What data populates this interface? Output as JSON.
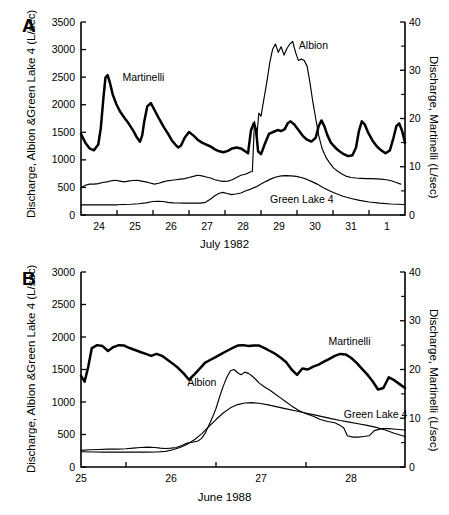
{
  "figure": {
    "panels": [
      {
        "letter": "A",
        "ylabel_left": "Discharge, Albion &Green Lake 4 (L/sec)",
        "ylabel_right": "Discharge, Martinelli (L/sec)",
        "xlabel": "July 1982"
      },
      {
        "letter": "B",
        "ylabel_left": "Discharge, Albion &Green Lake 4 (L/sec)",
        "ylabel_right": "Discharge, Martinelli (L/sec)",
        "xlabel": "June 1988"
      }
    ]
  },
  "chart_data": [
    {
      "type": "line",
      "title": "",
      "panel": "A",
      "xlabel": "July 1982",
      "ylabel": "Discharge, Albion &Green Lake 4 (L/sec)",
      "ylabel_right": "Discharge, Martinelli (L/sec)",
      "xlim": [
        23.5,
        32.5
      ],
      "ylim": [
        0,
        3500
      ],
      "ylim_right": [
        0,
        40
      ],
      "yticks": [
        0,
        500,
        1000,
        1500,
        2000,
        2500,
        3000,
        3500
      ],
      "yticks_right": [
        0,
        10,
        20,
        30,
        40
      ],
      "yticks_right_minor": [
        5,
        15,
        25,
        35
      ],
      "xticks": [
        24,
        25,
        26,
        27,
        28,
        29,
        30,
        31,
        32
      ],
      "xticklabels": [
        "24",
        "25",
        "26",
        "27",
        "28",
        "29",
        "30",
        "31",
        "1"
      ],
      "grid": false,
      "legend_position": "inline-annotations",
      "annotations": [
        {
          "text": "Martinelli",
          "x": 24.65,
          "y": 2430
        },
        {
          "text": "Albion",
          "x": 29.55,
          "y": 3010
        },
        {
          "text": "Green Lake 4",
          "x": 28.75,
          "y": 215
        }
      ],
      "series": [
        {
          "name": "Martinelli",
          "axis": "right",
          "units": "L/sec",
          "style": "thick",
          "x": [
            23.5,
            23.62,
            23.74,
            23.86,
            23.98,
            24.05,
            24.12,
            24.18,
            24.24,
            24.3,
            24.38,
            24.48,
            24.58,
            24.7,
            24.82,
            24.95,
            25.06,
            25.14,
            25.2,
            25.26,
            25.34,
            25.44,
            25.56,
            25.68,
            25.8,
            25.92,
            26.02,
            26.12,
            26.2,
            26.28,
            26.38,
            26.5,
            26.62,
            26.74,
            26.86,
            26.98,
            27.1,
            27.22,
            27.34,
            27.46,
            27.58,
            27.7,
            27.82,
            27.94,
            28.06,
            28.14,
            28.22,
            28.3,
            28.36,
            28.42,
            28.5,
            28.6,
            28.72,
            28.84,
            28.96,
            29.06,
            29.16,
            29.24,
            29.32,
            29.42,
            29.54,
            29.66,
            29.78,
            29.9,
            30.02,
            30.1,
            30.18,
            30.26,
            30.34,
            30.44,
            30.56,
            30.68,
            30.8,
            30.92,
            31.04,
            31.14,
            31.22,
            31.3,
            31.38,
            31.48,
            31.6,
            31.72,
            31.84,
            31.96,
            32.08,
            32.18,
            32.26,
            32.34,
            32.42,
            32.5
          ],
          "y_right": [
            16.8,
            15.0,
            13.8,
            13.4,
            14.6,
            18.0,
            24.0,
            28.5,
            29.0,
            27.5,
            25.0,
            23.0,
            21.5,
            20.2,
            19.0,
            17.5,
            16.0,
            15.2,
            16.5,
            19.5,
            22.5,
            23.2,
            21.5,
            19.8,
            18.2,
            16.8,
            15.5,
            14.6,
            14.0,
            14.4,
            16.0,
            17.2,
            16.5,
            15.6,
            15.0,
            14.6,
            14.2,
            13.6,
            13.2,
            13.0,
            13.3,
            13.8,
            14.0,
            13.8,
            13.2,
            12.8,
            17.5,
            19.0,
            17.8,
            13.2,
            12.6,
            14.6,
            16.8,
            17.2,
            17.6,
            17.4,
            17.8,
            19.0,
            19.4,
            18.8,
            17.6,
            16.4,
            15.6,
            15.2,
            16.0,
            18.4,
            19.6,
            18.4,
            16.6,
            15.0,
            14.0,
            13.2,
            12.6,
            12.2,
            12.4,
            14.0,
            17.4,
            19.4,
            18.8,
            17.0,
            15.4,
            14.2,
            13.4,
            12.8,
            13.4,
            16.0,
            18.4,
            19.0,
            17.4,
            15.0
          ]
        },
        {
          "name": "Albion",
          "axis": "left",
          "units": "L/sec",
          "style": "thin",
          "x": [
            23.5,
            23.62,
            23.74,
            23.86,
            23.98,
            24.1,
            24.22,
            24.34,
            24.46,
            24.58,
            24.7,
            24.82,
            24.94,
            25.06,
            25.18,
            25.3,
            25.42,
            25.54,
            25.66,
            25.78,
            25.9,
            26.02,
            26.14,
            26.26,
            26.38,
            26.5,
            26.62,
            26.74,
            26.86,
            26.98,
            27.1,
            27.22,
            27.34,
            27.46,
            27.58,
            27.7,
            27.82,
            27.94,
            28.06,
            28.14,
            28.2,
            28.26,
            28.32,
            28.38,
            28.44,
            28.5,
            28.58,
            28.66,
            28.74,
            28.82,
            28.9,
            28.98,
            29.06,
            29.14,
            29.22,
            29.3,
            29.38,
            29.46,
            29.54,
            29.62,
            29.7,
            29.78,
            29.86,
            29.94,
            30.02,
            30.1,
            30.2,
            30.3,
            30.4,
            30.52,
            30.64,
            30.76,
            30.88,
            31.0,
            31.14,
            31.28,
            31.42,
            31.56,
            31.7,
            31.84,
            31.98,
            32.12,
            32.26,
            32.38,
            32.5
          ],
          "y": [
            490,
            540,
            560,
            560,
            570,
            590,
            600,
            620,
            630,
            615,
            600,
            615,
            625,
            630,
            615,
            600,
            580,
            560,
            575,
            600,
            620,
            630,
            640,
            650,
            660,
            680,
            700,
            720,
            710,
            690,
            670,
            640,
            620,
            610,
            615,
            640,
            680,
            720,
            740,
            760,
            780,
            790,
            1700,
            1400,
            1850,
            1790,
            2100,
            2400,
            2750,
            3000,
            3100,
            2950,
            3050,
            2900,
            3020,
            3100,
            3150,
            2950,
            2800,
            2830,
            2800,
            2700,
            2400,
            2050,
            1750,
            1450,
            1200,
            1050,
            950,
            850,
            790,
            740,
            700,
            680,
            670,
            665,
            660,
            660,
            655,
            650,
            640,
            620,
            590,
            560
          ]
        },
        {
          "name": "Green Lake 4",
          "axis": "left",
          "units": "L/sec",
          "style": "thin",
          "x": [
            23.5,
            23.7,
            23.9,
            24.1,
            24.3,
            24.5,
            24.7,
            24.9,
            25.1,
            25.3,
            25.5,
            25.64,
            25.78,
            25.92,
            26.06,
            26.2,
            26.34,
            26.5,
            26.66,
            26.82,
            26.96,
            27.08,
            27.2,
            27.32,
            27.44,
            27.56,
            27.68,
            27.8,
            27.94,
            28.08,
            28.22,
            28.36,
            28.5,
            28.64,
            28.78,
            28.92,
            29.06,
            29.2,
            29.34,
            29.48,
            29.62,
            29.76,
            29.9,
            30.06,
            30.22,
            30.4,
            30.58,
            30.78,
            31.0,
            31.24,
            31.5,
            31.8,
            32.1,
            32.3,
            32.5
          ],
          "y": [
            185,
            185,
            185,
            185,
            185,
            185,
            190,
            195,
            205,
            220,
            245,
            250,
            245,
            230,
            220,
            218,
            215,
            215,
            215,
            215,
            230,
            280,
            340,
            390,
            410,
            390,
            370,
            380,
            400,
            440,
            470,
            510,
            560,
            610,
            655,
            690,
            710,
            715,
            710,
            700,
            680,
            650,
            610,
            560,
            500,
            440,
            390,
            340,
            300,
            265,
            235,
            215,
            200,
            195,
            190
          ]
        }
      ]
    },
    {
      "type": "line",
      "title": "",
      "panel": "B",
      "xlabel": "June 1988",
      "ylabel": "Discharge, Albion &Green Lake 4 (L/sec)",
      "ylabel_right": "Discharge, Martinelli (L/sec)",
      "xlim": [
        25.0,
        28.6
      ],
      "ylim": [
        0,
        3000
      ],
      "ylim_right": [
        0,
        40
      ],
      "yticks": [
        0,
        500,
        1000,
        1500,
        2000,
        2500,
        3000
      ],
      "yticks_right": [
        0,
        10,
        20,
        30,
        40
      ],
      "yticks_right_minor": [
        5,
        15,
        25,
        35
      ],
      "xticks": [
        25,
        26,
        27,
        28
      ],
      "xticklabels": [
        "25",
        "26",
        "27",
        "28"
      ],
      "grid": false,
      "legend_position": "inline-annotations",
      "annotations": [
        {
          "text": "Martinelli",
          "x": 27.75,
          "y": 1870
        },
        {
          "text": "Albion",
          "x": 26.18,
          "y": 1250
        },
        {
          "text": "Green Lake 4",
          "x": 27.92,
          "y": 760
        }
      ],
      "series": [
        {
          "name": "Martinelli",
          "axis": "right",
          "units": "L/sec",
          "style": "thick",
          "x": [
            25.0,
            25.04,
            25.08,
            25.12,
            25.18,
            25.24,
            25.3,
            25.36,
            25.42,
            25.48,
            25.54,
            25.6,
            25.66,
            25.72,
            25.78,
            25.84,
            25.9,
            25.96,
            26.02,
            26.08,
            26.14,
            26.2,
            26.26,
            26.32,
            26.38,
            26.44,
            26.5,
            26.56,
            26.62,
            26.68,
            26.74,
            26.8,
            26.86,
            26.92,
            26.98,
            27.04,
            27.1,
            27.16,
            27.22,
            27.28,
            27.34,
            27.4,
            27.46,
            27.52,
            27.58,
            27.64,
            27.7,
            27.76,
            27.82,
            27.88,
            27.94,
            28.0,
            28.06,
            28.12,
            28.18,
            28.24,
            28.3,
            28.36,
            28.42,
            28.48,
            28.54,
            28.6
          ],
          "y_right": [
            18.7,
            17.5,
            20.5,
            24.4,
            25.0,
            24.8,
            23.8,
            24.6,
            25.0,
            24.9,
            24.4,
            24.0,
            23.6,
            23.2,
            22.8,
            23.2,
            22.8,
            22.0,
            21.2,
            20.3,
            19.2,
            17.9,
            19.0,
            20.2,
            21.4,
            22.0,
            22.6,
            23.2,
            23.8,
            24.4,
            24.9,
            25.0,
            24.8,
            24.9,
            24.9,
            24.4,
            23.8,
            23.2,
            22.4,
            21.5,
            20.0,
            18.9,
            20.2,
            20.0,
            20.6,
            21.0,
            21.6,
            22.2,
            22.8,
            23.2,
            23.1,
            22.4,
            21.4,
            20.2,
            19.0,
            17.6,
            15.9,
            16.2,
            18.4,
            17.8,
            17.0,
            16.2
          ]
        },
        {
          "name": "Albion",
          "axis": "left",
          "units": "L/sec",
          "style": "thin",
          "x": [
            25.0,
            25.1,
            25.2,
            25.3,
            25.4,
            25.5,
            25.58,
            25.66,
            25.74,
            25.82,
            25.88,
            25.94,
            26.0,
            26.06,
            26.12,
            26.18,
            26.24,
            26.3,
            26.34,
            26.38,
            26.42,
            26.46,
            26.5,
            26.54,
            26.58,
            26.62,
            26.66,
            26.7,
            26.74,
            26.78,
            26.82,
            26.86,
            26.9,
            26.94,
            26.98,
            27.04,
            27.1,
            27.16,
            27.22,
            27.28,
            27.34,
            27.42,
            27.5,
            27.58,
            27.66,
            27.74,
            27.82,
            27.88,
            27.92,
            27.96,
            28.02,
            28.08,
            28.14,
            28.2,
            28.26,
            28.34,
            28.42,
            28.5,
            28.6
          ],
          "y": [
            255,
            265,
            270,
            275,
            275,
            280,
            290,
            300,
            305,
            300,
            290,
            285,
            290,
            300,
            330,
            370,
            380,
            400,
            440,
            520,
            640,
            760,
            900,
            1080,
            1240,
            1380,
            1480,
            1500,
            1450,
            1420,
            1460,
            1440,
            1400,
            1350,
            1290,
            1230,
            1180,
            1120,
            1060,
            1000,
            940,
            870,
            820,
            780,
            730,
            700,
            680,
            640,
            600,
            480,
            460,
            460,
            470,
            480,
            560,
            590,
            590,
            580,
            570
          ]
        },
        {
          "name": "Green Lake 4",
          "axis": "left",
          "units": "L/sec",
          "style": "thin",
          "x": [
            25.0,
            25.14,
            25.28,
            25.42,
            25.56,
            25.7,
            25.84,
            25.94,
            26.02,
            26.1,
            26.18,
            26.26,
            26.34,
            26.42,
            26.5,
            26.58,
            26.66,
            26.74,
            26.82,
            26.9,
            26.98,
            27.08,
            27.18,
            27.28,
            27.38,
            27.48,
            27.58,
            27.68,
            27.78,
            27.88,
            27.98,
            28.08,
            28.18,
            28.28,
            28.38,
            28.48,
            28.6
          ],
          "y": [
            235,
            230,
            228,
            228,
            228,
            228,
            230,
            240,
            265,
            300,
            350,
            420,
            510,
            620,
            730,
            830,
            910,
            960,
            985,
            990,
            980,
            955,
            925,
            895,
            865,
            835,
            805,
            775,
            745,
            715,
            690,
            665,
            640,
            610,
            570,
            520,
            470
          ]
        }
      ]
    }
  ]
}
